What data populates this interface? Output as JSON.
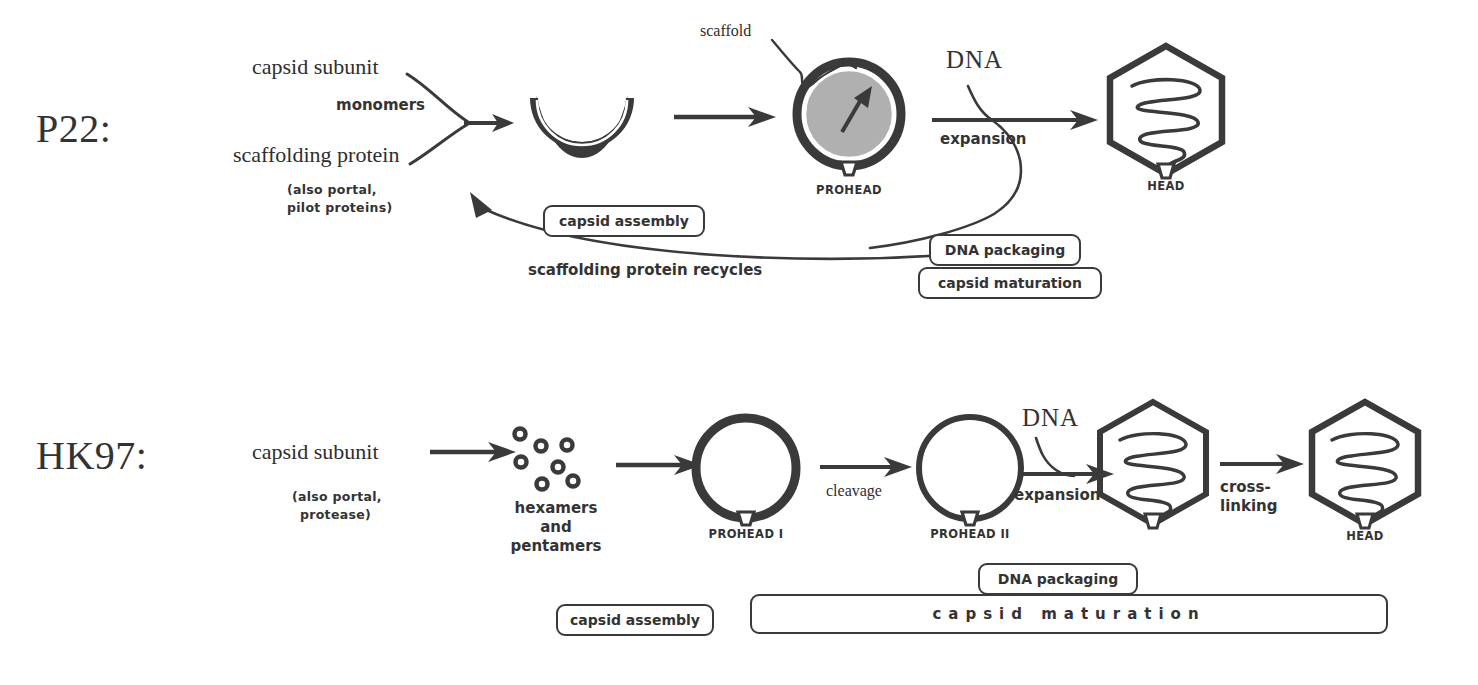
{
  "diagram": {
    "background": "#ffffff",
    "ink": "#333333",
    "shell_fill": "#3a3a3a",
    "scaffold_fill": "#b0b0b0"
  },
  "p22": {
    "name": "P22:",
    "inputs": {
      "capsid_subunit": "capsid subunit",
      "monomers": "monomers",
      "scaffolding_protein": "scaffolding protein",
      "also_line1": "(also portal,",
      "also_line2": "pilot proteins)"
    },
    "scaffold_label": "scaffold",
    "prohead_label": "PROHEAD",
    "head_label": "HEAD",
    "dna_label": "DNA",
    "expansion_label": "expansion",
    "recycle_label": "scaffolding protein recycles",
    "boxes": {
      "capsid_assembly": "capsid assembly",
      "dna_packaging": "DNA packaging",
      "capsid_maturation": "capsid maturation"
    }
  },
  "hk97": {
    "name": "HK97:",
    "inputs": {
      "capsid_subunit": "capsid subunit",
      "also_line1": "(also portal,",
      "also_line2": "protease)"
    },
    "oligomers": {
      "line1": "hexamers",
      "line2": "and",
      "line3": "pentamers"
    },
    "prohead_i_label": "PROHEAD I",
    "prohead_ii_label": "PROHEAD II",
    "head_label": "HEAD",
    "cleavage_label": "cleavage",
    "dna_label": "DNA",
    "expansion_label": "expansion",
    "crosslink_line1": "cross-",
    "crosslink_line2": "linking",
    "boxes": {
      "capsid_assembly": "capsid assembly",
      "dna_packaging": "DNA packaging",
      "capsid_maturation": "capsid   maturation"
    }
  }
}
